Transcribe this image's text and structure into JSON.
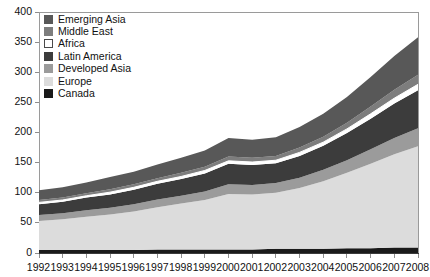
{
  "chart_data": {
    "type": "area",
    "title": "",
    "xlabel": "",
    "ylabel": "",
    "stacked": true,
    "grid": false,
    "legend_position": "top-left",
    "ylim": [
      0,
      400
    ],
    "xlim": [
      1992,
      2008
    ],
    "yticks": [
      0,
      50,
      100,
      150,
      200,
      250,
      300,
      350,
      400
    ],
    "categories": [
      1992,
      1993,
      1994,
      1995,
      1996,
      1997,
      1998,
      1999,
      2000,
      2001,
      2002,
      2003,
      2004,
      2005,
      2006,
      2007,
      2008
    ],
    "stack_order_bottom_to_top": [
      "Canada",
      "Europe",
      "Developed Asia",
      "Latin America",
      "Africa",
      "Middle East",
      "Emerging Asia"
    ],
    "series": [
      {
        "name": "Canada",
        "color": "#1a1a1a",
        "values": [
          5,
          5,
          5,
          5,
          5,
          6,
          6,
          6,
          6,
          6,
          7,
          7,
          7,
          8,
          8,
          9,
          9
        ]
      },
      {
        "name": "Europe",
        "color": "#dcdcdc",
        "values": [
          48,
          51,
          55,
          59,
          64,
          70,
          76,
          82,
          92,
          91,
          93,
          101,
          112,
          125,
          140,
          155,
          168
        ]
      },
      {
        "name": "Developed Asia",
        "color": "#9b9b9b",
        "values": [
          10,
          10,
          11,
          11,
          12,
          13,
          13,
          14,
          16,
          16,
          16,
          17,
          19,
          21,
          24,
          27,
          30
        ]
      },
      {
        "name": "Latin America",
        "color": "#3c3c3c",
        "values": [
          18,
          19,
          21,
          22,
          24,
          26,
          28,
          30,
          34,
          33,
          33,
          36,
          40,
          45,
          51,
          57,
          63
        ]
      },
      {
        "name": "Africa",
        "color": "#ffffff",
        "values": [
          3,
          3,
          3,
          4,
          4,
          4,
          4,
          5,
          5,
          5,
          5,
          6,
          6,
          7,
          8,
          9,
          10
        ]
      },
      {
        "name": "Middle East",
        "color": "#7d7d7d",
        "values": [
          4,
          4,
          4,
          5,
          5,
          5,
          6,
          6,
          7,
          7,
          7,
          8,
          9,
          10,
          12,
          14,
          16
        ]
      },
      {
        "name": "Emerging Asia",
        "color": "#585858",
        "values": [
          16,
          17,
          18,
          20,
          21,
          23,
          25,
          27,
          31,
          30,
          31,
          34,
          38,
          43,
          49,
          56,
          62
        ]
      }
    ],
    "totals": [
      104,
      109,
      117,
      126,
      135,
      147,
      158,
      170,
      191,
      188,
      192,
      209,
      231,
      259,
      292,
      327,
      358
    ],
    "tick_labels_y": [
      "0",
      "50",
      "100",
      "150",
      "200",
      "250",
      "300",
      "350",
      "400"
    ],
    "tick_labels_x": [
      "1992",
      "1993",
      "1994",
      "1995",
      "1996",
      "1997",
      "1998",
      "1999",
      "2000",
      "2001",
      "2002",
      "2003",
      "2004",
      "2005",
      "2006",
      "2007",
      "2008"
    ]
  },
  "legend": {
    "items": [
      {
        "label": "Emerging Asia",
        "color": "#585858",
        "border": "#585858"
      },
      {
        "label": "Middle East",
        "color": "#7d7d7d",
        "border": "#7d7d7d"
      },
      {
        "label": "Africa",
        "color": "#ffffff",
        "border": "#4a4a4a"
      },
      {
        "label": "Latin America",
        "color": "#3c3c3c",
        "border": "#3c3c3c"
      },
      {
        "label": "Developed Asia",
        "color": "#9b9b9b",
        "border": "#9b9b9b"
      },
      {
        "label": "Europe",
        "color": "#dcdcdc",
        "border": "#dcdcdc"
      },
      {
        "label": "Canada",
        "color": "#1a1a1a",
        "border": "#1a1a1a"
      }
    ]
  },
  "axes": {
    "line_color": "#9a9a9a",
    "baseline_color": "#3a3a3a",
    "separator_color": "#ffffff"
  }
}
